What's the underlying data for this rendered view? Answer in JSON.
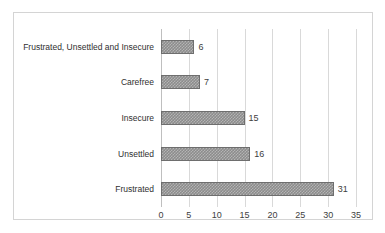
{
  "chart_data": {
    "type": "bar",
    "orientation": "horizontal",
    "title": "",
    "xlabel": "",
    "ylabel": "",
    "categories": [
      "Frustrated, Unsettled and Insecure",
      "Carefree",
      "Insecure",
      "Unsettled",
      "Frustrated"
    ],
    "values": [
      6,
      7,
      15,
      16,
      31
    ],
    "data_labels": [
      "6",
      "7",
      "15",
      "16",
      "31"
    ],
    "xlim": [
      0,
      35
    ],
    "xticks": [
      0,
      5,
      10,
      15,
      20,
      25,
      30,
      35
    ],
    "xtick_labels": [
      "0",
      "5",
      "10",
      "15",
      "20",
      "25",
      "30",
      "35"
    ],
    "grid": "vertical",
    "legend": "none",
    "series": [
      {
        "name": "",
        "values": [
          6,
          7,
          15,
          16,
          31
        ]
      }
    ]
  },
  "figure": {
    "border_color": "#d4d4d4",
    "background": "#ffffff",
    "bar_fill": "#8c8c8c",
    "bar_pattern": "#b4b4b4",
    "bar_outline": "#6e6e6e",
    "gridline_color": "#d9d9d9",
    "text_color": "#2f2f2f"
  },
  "caption": {
    "text": ""
  }
}
